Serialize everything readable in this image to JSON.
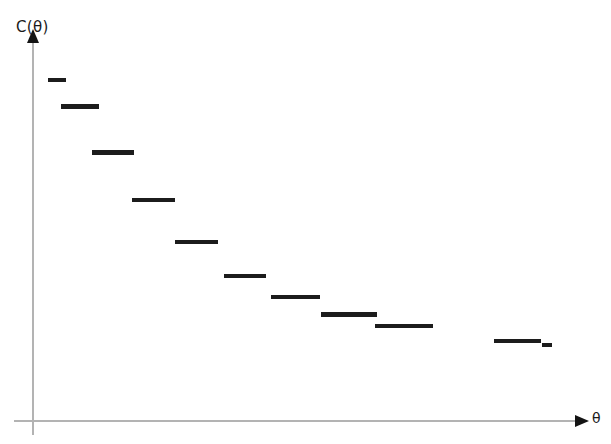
{
  "chart_data": {
    "type": "line",
    "style": "step",
    "title": "",
    "subtitle": "",
    "xlabel": "θ",
    "ylabel": "C(θ)",
    "grid": false,
    "legend": null,
    "axis_arrows": true,
    "axis_color": "#b3b3b3",
    "series_color": "#1c1c1c",
    "background": "#ffffff",
    "xlim": [
      0,
      100
    ],
    "ylim": [
      0,
      100
    ],
    "x_tick_labels": [],
    "y_tick_labels": [],
    "annotations": [],
    "categories": [
      "s1",
      "s2",
      "s3",
      "s4",
      "s5",
      "s6",
      "s7",
      "s8",
      "s9",
      "s10",
      "s11"
    ],
    "values": [
      89.5,
      82.5,
      70.5,
      58.0,
      47.0,
      38.0,
      32.5,
      28.0,
      25.0,
      21.0,
      20.0
    ],
    "steps": [
      {
        "name": "s1",
        "x_start": 2.7,
        "x_end": 6.1,
        "y": 89.5
      },
      {
        "name": "s2",
        "x_start": 5.2,
        "x_end": 12.2,
        "y": 82.5
      },
      {
        "name": "s3",
        "x_start": 10.9,
        "x_end": 18.6,
        "y": 70.5
      },
      {
        "name": "s4",
        "x_start": 18.2,
        "x_end": 26.0,
        "y": 58.0
      },
      {
        "name": "s5",
        "x_start": 26.0,
        "x_end": 33.9,
        "y": 47.0
      },
      {
        "name": "s6",
        "x_start": 35.0,
        "x_end": 42.8,
        "y": 38.0
      },
      {
        "name": "s7",
        "x_start": 43.6,
        "x_end": 52.6,
        "y": 32.5
      },
      {
        "name": "s8",
        "x_start": 52.8,
        "x_end": 63.2,
        "y": 28.0
      },
      {
        "name": "s9",
        "x_start": 62.7,
        "x_end": 73.4,
        "y": 25.0
      },
      {
        "name": "s10",
        "x_start": 84.6,
        "x_end": 93.2,
        "y": 21.0
      },
      {
        "name": "s11",
        "x_start": 93.4,
        "x_end": 95.2,
        "y": 20.0
      }
    ]
  },
  "labels": {
    "y_axis": "C(θ)",
    "x_axis": "θ"
  },
  "icons": {
    "y_arrow": "arrow-up-icon",
    "x_arrow": "arrow-right-icon"
  }
}
